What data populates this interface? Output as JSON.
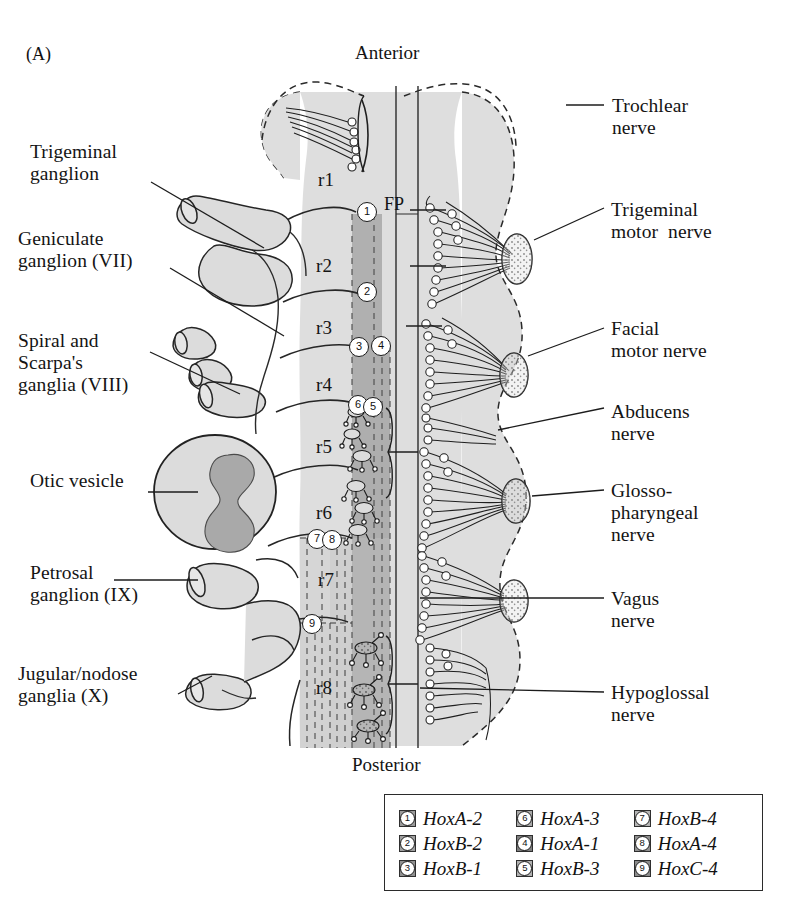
{
  "panel": {
    "label": "(A)"
  },
  "orientation": {
    "anterior": "Anterior",
    "posterior": "Posterior"
  },
  "midline": {
    "floor_plate": "FP"
  },
  "rhombomeres": [
    {
      "id": "r1",
      "label": "r1",
      "x": 318,
      "y": 169
    },
    {
      "id": "r2",
      "label": "r2",
      "x": 316,
      "y": 255
    },
    {
      "id": "r3",
      "label": "r3",
      "x": 316,
      "y": 317
    },
    {
      "id": "r4",
      "label": "r4",
      "x": 316,
      "y": 374
    },
    {
      "id": "r5",
      "label": "r5",
      "x": 316,
      "y": 436
    },
    {
      "id": "r6",
      "label": "r6",
      "x": 316,
      "y": 502
    },
    {
      "id": "r7",
      "label": "r7",
      "x": 318,
      "y": 569
    },
    {
      "id": "r8",
      "label": "r8",
      "x": 316,
      "y": 677
    }
  ],
  "left_labels": [
    {
      "name": "trigeminal-ganglion",
      "text": "Trigeminal\nganglion",
      "x": 30,
      "y": 141
    },
    {
      "name": "geniculate-ganglion",
      "text": "Geniculate\nganglion (VII)",
      "x": 18,
      "y": 228
    },
    {
      "name": "spiral-scarpas-ganglia",
      "text": "Spiral and\nScarpa's\nganglia (VIII)",
      "x": 18,
      "y": 330
    },
    {
      "name": "otic-vesicle",
      "text": "Otic vesicle",
      "x": 30,
      "y": 470
    },
    {
      "name": "petrosal-ganglion",
      "text": "Petrosal\nganglion (IX)",
      "x": 30,
      "y": 562
    },
    {
      "name": "jugular-nodose-ganglia",
      "text": "Jugular/nodose\nganglia (X)",
      "x": 18,
      "y": 663
    }
  ],
  "right_labels": [
    {
      "name": "trochlear-nerve",
      "text": "Trochlear\nnerve",
      "x": 612,
      "y": 95
    },
    {
      "name": "trigeminal-motor-nerve",
      "text": "Trigeminal\nmotor  nerve",
      "x": 611,
      "y": 199
    },
    {
      "name": "facial-motor-nerve",
      "text": "Facial\nmotor nerve",
      "x": 611,
      "y": 318
    },
    {
      "name": "abducens-nerve",
      "text": "Abducens\nnerve",
      "x": 611,
      "y": 401
    },
    {
      "name": "glossopharyngeal-nerve",
      "text": "Glosso-\npharyngeal\nnerve",
      "x": 611,
      "y": 480
    },
    {
      "name": "vagus-nerve",
      "text": "Vagus\nnerve",
      "x": 611,
      "y": 588
    },
    {
      "name": "hypoglossal-nerve",
      "text": "Hypoglossal\nnerve",
      "x": 611,
      "y": 682
    }
  ],
  "markers": [
    {
      "n": "1",
      "x": 366,
      "y": 211
    },
    {
      "n": "2",
      "x": 366,
      "y": 291
    },
    {
      "n": "3",
      "x": 358,
      "y": 346
    },
    {
      "n": "4",
      "x": 380,
      "y": 345
    },
    {
      "n": "6",
      "x": 357,
      "y": 404
    },
    {
      "n": "5",
      "x": 372,
      "y": 406
    },
    {
      "n": "7",
      "x": 316,
      "y": 538
    },
    {
      "n": "8",
      "x": 331,
      "y": 539
    },
    {
      "n": "9",
      "x": 311,
      "y": 623
    }
  ],
  "legend": {
    "entries": [
      {
        "n": "1",
        "gene": "HoxA-2",
        "shade": "#9a9a9a"
      },
      {
        "n": "6",
        "gene": "HoxA-3",
        "shade": "#a8a8a8"
      },
      {
        "n": "7",
        "gene": "HoxB-4",
        "shade": "#b4b4b4"
      },
      {
        "n": "2",
        "gene": "HoxB-2",
        "shade": "#9e9e9e"
      },
      {
        "n": "4",
        "gene": "HoxA-1",
        "shade": "#7e7e7e"
      },
      {
        "n": "8",
        "gene": "HoxA-4",
        "shade": "#8f8f8f"
      },
      {
        "n": "3",
        "gene": "HoxB-1",
        "shade": "#909090"
      },
      {
        "n": "5",
        "gene": "HoxB-3",
        "shade": "#b0b0b0"
      },
      {
        "n": "9",
        "gene": "HoxC-4",
        "shade": "#8b8b8b"
      }
    ]
  },
  "colors": {
    "tissue_fill": "#dedede",
    "hox_stripe": "#b3b3b3",
    "otic_inner": "#a9a9a9",
    "nerve_root": "#d2d2d2",
    "ink": "#1a1a1a",
    "paper": "#ffffff"
  }
}
